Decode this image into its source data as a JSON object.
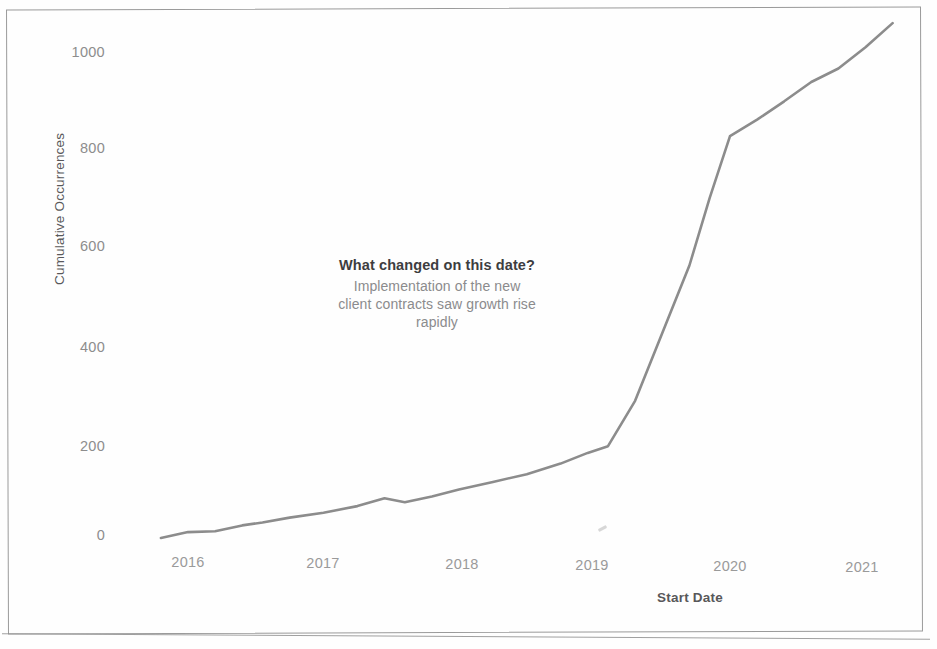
{
  "chart_data": {
    "type": "line",
    "title": "",
    "xlabel": "Start Date",
    "ylabel": "Cumulative Occurrences",
    "xlim": [
      2015.8,
      2021.3
    ],
    "ylim": [
      -40,
      1100
    ],
    "grid": false,
    "legend": "none",
    "line_color": "#8c8c8c",
    "x_tick_labels": [
      "2016",
      "2017",
      "2018",
      "2019",
      "2020",
      "2021"
    ],
    "x_ticks": [
      2016,
      2017,
      2018,
      2019,
      2020,
      2021
    ],
    "y_tick_labels": [
      "0",
      "200",
      "400",
      "600",
      "800",
      "1000"
    ],
    "y_ticks": [
      0,
      200,
      400,
      600,
      800,
      1000
    ],
    "series": [
      {
        "name": "Cumulative Occurrences",
        "x": [
          2015.8,
          2016.0,
          2016.2,
          2016.4,
          2016.55,
          2016.75,
          2017.0,
          2017.25,
          2017.45,
          2017.6,
          2017.8,
          2018.0,
          2018.25,
          2018.5,
          2018.75,
          2018.95,
          2019.1,
          2019.3,
          2019.5,
          2019.7,
          2019.85,
          2020.0,
          2020.2,
          2020.4,
          2020.6,
          2020.8,
          2021.0,
          2021.2
        ],
        "values": [
          -4,
          8,
          10,
          22,
          28,
          38,
          48,
          62,
          78,
          70,
          82,
          96,
          112,
          128,
          150,
          172,
          186,
          280,
          420,
          560,
          700,
          828,
          862,
          900,
          940,
          968,
          1012,
          1062
        ]
      }
    ],
    "annotation": {
      "heading": "What changed on this date?",
      "body": "Implementation of the new client contracts saw growth rise rapidly"
    }
  },
  "annotation": {
    "heading": "What changed on this date?",
    "body": "Implementation of the new client contracts saw growth rise rapidly"
  },
  "axes": {
    "x_title": "Start Date",
    "y_title": "Cumulative Occurrences"
  }
}
